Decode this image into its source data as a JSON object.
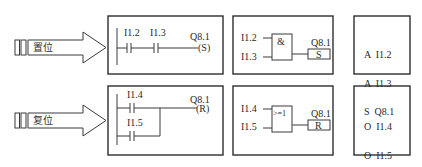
{
  "rows": [
    {
      "id": "set",
      "arrow_label": "置位",
      "ladder": {
        "contacts": [
          "I1.2",
          "I1.3"
        ],
        "layout": "series",
        "coil_address": "Q8.1",
        "coil_type": "(S)"
      },
      "fbd": {
        "inputs": [
          "I1.2",
          "I1.3"
        ],
        "gate_symbol": "&",
        "output_address": "Q8.1",
        "output_box": "S"
      },
      "stl": {
        "lines": [
          "A  I1.2",
          "A  I1.3",
          "S  Q8.1"
        ]
      }
    },
    {
      "id": "reset",
      "arrow_label": "复位",
      "ladder": {
        "contacts": [
          "I1.4",
          "I1.5"
        ],
        "layout": "parallel",
        "coil_address": "Q8.1",
        "coil_type": "(R)"
      },
      "fbd": {
        "inputs": [
          "I1.4",
          "I1.5"
        ],
        "gate_symbol": ">=1",
        "output_address": "Q8.1",
        "output_box": "R"
      },
      "stl": {
        "lines": [
          "O  I1.4",
          "O  I1.5",
          "R  Q8.1"
        ]
      }
    }
  ]
}
